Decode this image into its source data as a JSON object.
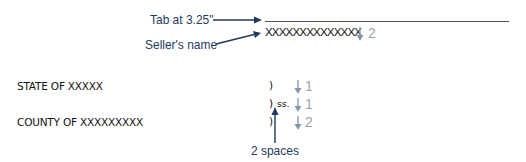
{
  "callouts": {
    "tab_label": "Tab at 3.25\"",
    "seller_label": "Seller's name",
    "spaces_label": "2 spaces"
  },
  "document": {
    "seller_placeholder": "XXXXXXXXXXXXXX",
    "state_line": "STATE OF XXXXX",
    "county_line": "COUNTY OF XXXXXXXXX",
    "paren_1": ")",
    "paren_2": ")",
    "ss_label": "ss.",
    "paren_3": ")"
  },
  "spacing_markers": [
    {
      "row": "seller",
      "value": "2"
    },
    {
      "row": "state",
      "value": "1"
    },
    {
      "row": "ss",
      "value": "1"
    },
    {
      "row": "county",
      "value": "2"
    }
  ],
  "colors": {
    "callout_arrow": "#1f3a5c",
    "spacing_marker": "#8496a8",
    "signature_line": "#555555"
  }
}
